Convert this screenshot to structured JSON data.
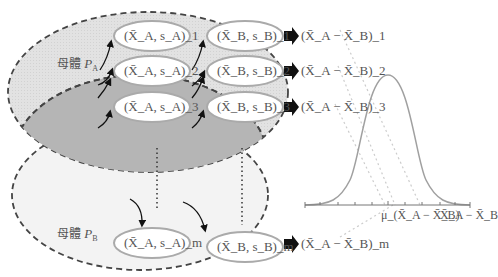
{
  "populations": {
    "A": {
      "label": "母體",
      "symbol": "P",
      "subscript": "A"
    },
    "B": {
      "label": "母體",
      "symbol": "P",
      "subscript": "B"
    }
  },
  "samples": [
    {
      "a": "(X̄_A, s_A)_1",
      "b": "(X̄_B, s_B)_1",
      "diff": "(X̄_A − X̄_B)_1",
      "index": "1"
    },
    {
      "a": "(X̄_A, s_A)_2",
      "b": "(X̄_B, s_B)_2",
      "diff": "(X̄_A − X̄_B)_2",
      "index": "2"
    },
    {
      "a": "(X̄_A, s_A)_3",
      "b": "(X̄_B, s_B)_3",
      "diff": "(X̄_A − X̄_B)_3",
      "index": "3"
    },
    {
      "a": "(X̄_A, s_A)_m",
      "b": "(X̄_B, s_B)_m",
      "diff": "(X̄_A − X̄_B)_m",
      "index": "m"
    }
  ],
  "distribution": {
    "type": "normal curve",
    "center_label": "μ_(X̄_A − X̄_B)",
    "axis_label": "X̄_A − X̄_B"
  },
  "colors": {
    "population_A_fill": "#e4e4e4",
    "overlap_fill": "#b4b4b4",
    "population_B_fill": "#f2f2f2",
    "ellipse_stroke": "#aaaaaa",
    "curve": "#999999",
    "arrow": "#111111"
  }
}
